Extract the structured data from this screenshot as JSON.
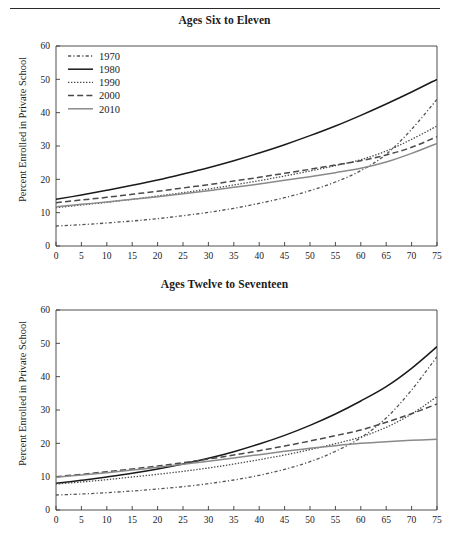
{
  "figure": {
    "has_top_rule": true,
    "x_axis_label": "Percent of Black Children in Community",
    "y_axis_label": "Percent Enrolled in Private School"
  },
  "legend": {
    "position": "top-left",
    "entries": [
      {
        "label": "1970",
        "style": "dash-dot",
        "color": "#555555"
      },
      {
        "label": "1980",
        "style": "solid",
        "color": "#1a1a1a"
      },
      {
        "label": "1990",
        "style": "dotted",
        "color": "#4a4a4a"
      },
      {
        "label": "2000",
        "style": "dashed",
        "color": "#4a4a4a"
      },
      {
        "label": "2010",
        "style": "solid",
        "color": "#8a8a8a"
      }
    ]
  },
  "chart_data": [
    {
      "type": "line",
      "title": "Ages Six to Eleven",
      "xlabel": "",
      "ylabel": "Percent Enrolled in Private School",
      "xlim": [
        0,
        75
      ],
      "ylim": [
        0,
        60
      ],
      "xticks": [
        0,
        5,
        10,
        15,
        20,
        25,
        30,
        35,
        40,
        45,
        50,
        55,
        60,
        65,
        70,
        75
      ],
      "yticks": [
        0,
        10,
        20,
        30,
        40,
        50,
        60
      ],
      "grid": false,
      "legend_position": "top-left",
      "x": [
        0,
        5,
        10,
        15,
        20,
        25,
        30,
        35,
        40,
        45,
        50,
        55,
        60,
        65,
        70,
        75
      ],
      "series": [
        {
          "name": "1970",
          "style": "dash-dot",
          "color": "#555555",
          "values": [
            6.0,
            6.4,
            6.9,
            7.5,
            8.2,
            9.1,
            10.1,
            11.3,
            12.8,
            14.5,
            16.6,
            19.2,
            22.6,
            27.5,
            35.0,
            44.0
          ]
        },
        {
          "name": "1980",
          "style": "solid",
          "color": "#1a1a1a",
          "values": [
            14.0,
            15.3,
            16.7,
            18.2,
            19.8,
            21.6,
            23.5,
            25.6,
            27.9,
            30.4,
            33.1,
            36.0,
            39.2,
            42.6,
            46.2,
            50.0
          ]
        },
        {
          "name": "1990",
          "style": "dotted",
          "color": "#4a4a4a",
          "values": [
            11.5,
            12.3,
            13.1,
            14.0,
            15.0,
            16.0,
            17.1,
            18.3,
            19.6,
            21.0,
            22.5,
            24.1,
            25.9,
            28.5,
            32.0,
            36.0
          ]
        },
        {
          "name": "2000",
          "style": "dashed",
          "color": "#4a4a4a",
          "values": [
            13.0,
            13.8,
            14.6,
            15.5,
            16.4,
            17.4,
            18.4,
            19.5,
            20.6,
            21.8,
            23.0,
            24.3,
            25.6,
            27.3,
            29.6,
            32.8
          ]
        },
        {
          "name": "2010",
          "style": "solid",
          "color": "#8a8a8a",
          "values": [
            11.8,
            12.5,
            13.2,
            14.0,
            14.8,
            15.7,
            16.6,
            17.6,
            18.6,
            19.7,
            20.8,
            22.0,
            23.3,
            25.2,
            27.8,
            30.8
          ]
        }
      ]
    },
    {
      "type": "line",
      "title": "Ages Twelve to Seventeen",
      "xlabel": "Percent of Black Children in Community",
      "ylabel": "Percent Enrolled in Private School",
      "xlim": [
        0,
        75
      ],
      "ylim": [
        0,
        60
      ],
      "xticks": [
        0,
        5,
        10,
        15,
        20,
        25,
        30,
        35,
        40,
        45,
        50,
        55,
        60,
        65,
        70,
        75
      ],
      "yticks": [
        0,
        10,
        20,
        30,
        40,
        50,
        60
      ],
      "grid": false,
      "legend_position": "none",
      "x": [
        0,
        5,
        10,
        15,
        20,
        25,
        30,
        35,
        40,
        45,
        50,
        55,
        60,
        65,
        70,
        75
      ],
      "series": [
        {
          "name": "1970",
          "style": "dash-dot",
          "color": "#555555",
          "values": [
            4.5,
            4.8,
            5.2,
            5.7,
            6.3,
            7.0,
            7.9,
            9.0,
            10.4,
            12.2,
            14.5,
            17.6,
            21.7,
            27.6,
            36.0,
            46.0
          ]
        },
        {
          "name": "1980",
          "style": "solid",
          "color": "#1a1a1a",
          "values": [
            8.0,
            8.9,
            9.9,
            11.0,
            12.3,
            13.8,
            15.5,
            17.5,
            19.8,
            22.4,
            25.4,
            28.8,
            32.7,
            37.0,
            42.5,
            49.0
          ]
        },
        {
          "name": "1990",
          "style": "dotted",
          "color": "#4a4a4a",
          "values": [
            7.8,
            8.4,
            9.1,
            9.9,
            10.7,
            11.6,
            12.6,
            13.8,
            15.1,
            16.5,
            18.1,
            19.9,
            21.9,
            24.8,
            28.8,
            34.0
          ]
        },
        {
          "name": "2000",
          "style": "dashed",
          "color": "#4a4a4a",
          "values": [
            10.0,
            10.7,
            11.5,
            12.3,
            13.2,
            14.2,
            15.3,
            16.5,
            17.8,
            19.2,
            20.7,
            22.3,
            24.0,
            26.3,
            28.9,
            31.8
          ]
        },
        {
          "name": "2010",
          "style": "solid",
          "color": "#8a8a8a",
          "values": [
            9.8,
            10.5,
            11.2,
            12.0,
            12.8,
            13.7,
            14.6,
            15.6,
            16.6,
            17.6,
            18.5,
            19.3,
            20.0,
            20.5,
            20.9,
            21.2
          ]
        }
      ]
    }
  ]
}
